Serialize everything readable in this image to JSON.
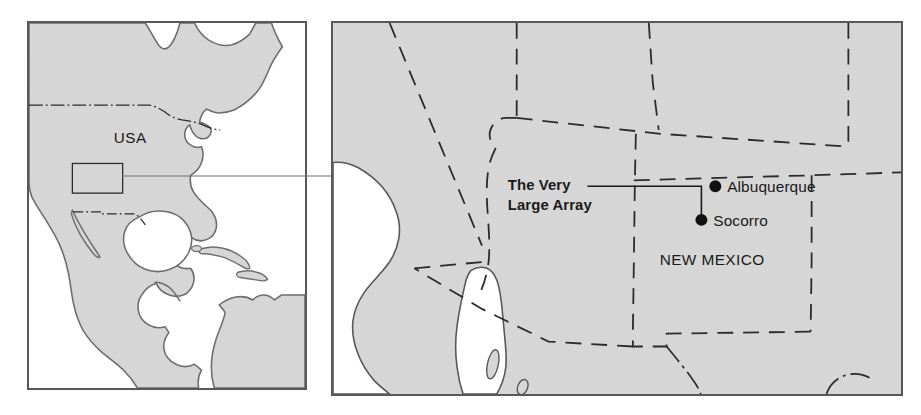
{
  "figure": {
    "background_color": "#ffffff",
    "land_fill": "#d6d6d6",
    "water_fill": "#ffffff",
    "coastline_color": "#6e6e70",
    "border_color": "#58585a",
    "dash_border_color": "#2b2b2b",
    "text_color": "#1a1a1a"
  },
  "overview_panel": {
    "name": "North America overview inset",
    "country_label": "USA",
    "highlight_box": {
      "label": "detail-area-highlight",
      "x": 71,
      "y": 163,
      "width": 51,
      "height": 30
    },
    "connector": {
      "label": "inset-connector-line",
      "from_x": 122,
      "from_y": 176,
      "to_x": 331,
      "to_y": 176
    }
  },
  "detail_panel": {
    "name": "New Mexico detail map",
    "state_label": "NEW MEXICO",
    "annotation": {
      "line1": "The Very",
      "line2": "Large Array",
      "leader": {
        "start_x": 588,
        "start_y": 186,
        "corner_x": 702,
        "corner_y": 186,
        "end_x": 702,
        "end_y": 214
      }
    },
    "cities": [
      {
        "name": "Albuquerque",
        "marker_x": 716,
        "marker_y": 186,
        "label_x": 728,
        "label_y": 192,
        "marker_radius": 6
      },
      {
        "name": "Socorro",
        "marker_x": 702,
        "marker_y": 220,
        "label_x": 714,
        "label_y": 226,
        "marker_radius": 6
      }
    ]
  }
}
